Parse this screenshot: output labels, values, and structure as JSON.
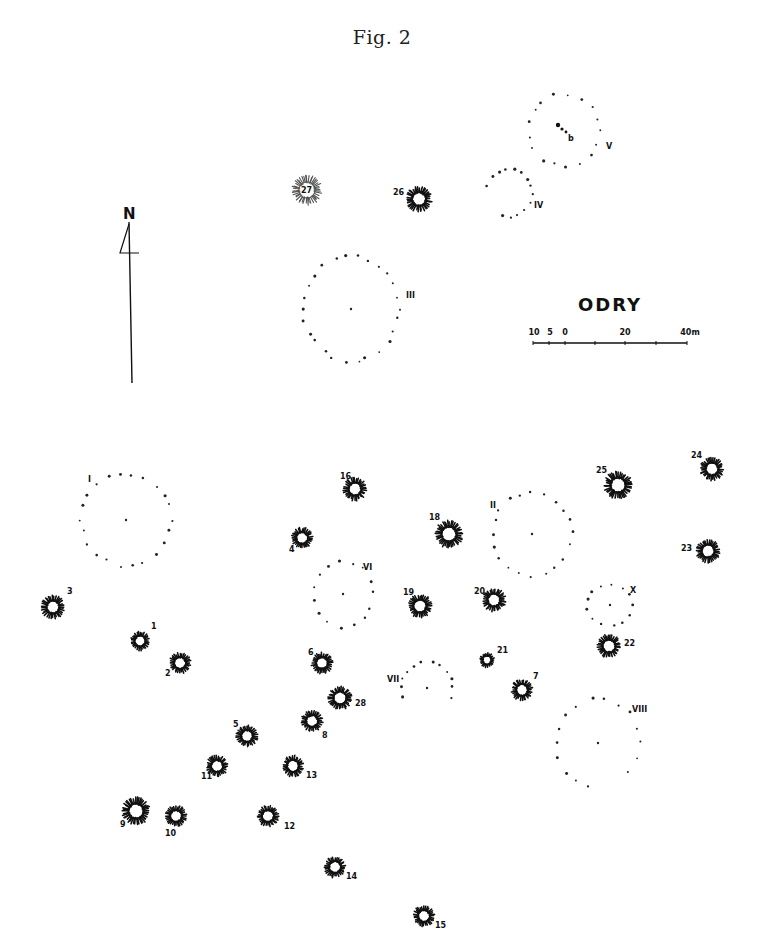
{
  "figure": {
    "title": "Fig. 2"
  },
  "site": {
    "name": "ODRY"
  },
  "north_arrow": {
    "label": "N",
    "x": 131,
    "top": 222,
    "bottom": 383
  },
  "scale_bar": {
    "x_start": 533,
    "x_end": 687,
    "y": 343,
    "labels": [
      {
        "text": "10",
        "x": 534
      },
      {
        "text": "5",
        "x": 550
      },
      {
        "text": "0",
        "x": 565
      },
      {
        "text": "20",
        "x": 625
      },
      {
        "text": "40m",
        "x": 690
      }
    ],
    "ticks": [
      533,
      549,
      565,
      595,
      625,
      656,
      687
    ]
  },
  "barrows": [
    {
      "id": "1",
      "x": 140,
      "y": 641,
      "r": 9,
      "label": "1",
      "lx": 151,
      "ly": 629
    },
    {
      "id": "2",
      "x": 180,
      "y": 663,
      "r": 10,
      "label": "2",
      "lx": 165,
      "ly": 676
    },
    {
      "id": "3",
      "x": 53,
      "y": 607,
      "r": 11,
      "label": "3",
      "lx": 67,
      "ly": 594
    },
    {
      "id": "4",
      "x": 302,
      "y": 538,
      "r": 10,
      "label": "4",
      "lx": 289,
      "ly": 552
    },
    {
      "id": "5",
      "x": 247,
      "y": 736,
      "r": 10,
      "label": "5",
      "lx": 233,
      "ly": 727
    },
    {
      "id": "6",
      "x": 322,
      "y": 663,
      "r": 10,
      "label": "6",
      "lx": 308,
      "ly": 655
    },
    {
      "id": "7",
      "x": 522,
      "y": 690,
      "r": 10,
      "label": "7",
      "lx": 533,
      "ly": 679
    },
    {
      "id": "8",
      "x": 312,
      "y": 721,
      "r": 10,
      "label": "8",
      "lx": 322,
      "ly": 738
    },
    {
      "id": "9",
      "x": 136,
      "y": 811,
      "r": 13,
      "label": "9",
      "lx": 120,
      "ly": 827
    },
    {
      "id": "10",
      "x": 176,
      "y": 816,
      "r": 10,
      "label": "10",
      "lx": 165,
      "ly": 836
    },
    {
      "id": "11",
      "x": 217,
      "y": 766,
      "r": 10,
      "label": "11",
      "lx": 201,
      "ly": 779
    },
    {
      "id": "12",
      "x": 268,
      "y": 816,
      "r": 10,
      "label": "12",
      "lx": 284,
      "ly": 829
    },
    {
      "id": "13",
      "x": 293,
      "y": 766,
      "r": 10,
      "label": "13",
      "lx": 306,
      "ly": 778
    },
    {
      "id": "14",
      "x": 335,
      "y": 867,
      "r": 10,
      "label": "14",
      "lx": 346,
      "ly": 879
    },
    {
      "id": "15",
      "x": 424,
      "y": 916,
      "r": 10,
      "label": "15",
      "lx": 435,
      "ly": 928
    },
    {
      "id": "16",
      "x": 355,
      "y": 489,
      "r": 11,
      "label": "16",
      "lx": 340,
      "ly": 479
    },
    {
      "id": "18",
      "x": 449,
      "y": 534,
      "r": 13,
      "label": "18",
      "lx": 429,
      "ly": 520
    },
    {
      "id": "19",
      "x": 420,
      "y": 606,
      "r": 11,
      "label": "19",
      "lx": 403,
      "ly": 595
    },
    {
      "id": "20",
      "x": 494,
      "y": 600,
      "r": 11,
      "label": "20",
      "lx": 474,
      "ly": 594
    },
    {
      "id": "21",
      "x": 487,
      "y": 660,
      "r": 7,
      "label": "21",
      "lx": 497,
      "ly": 653
    },
    {
      "id": "22",
      "x": 609,
      "y": 646,
      "r": 11,
      "label": "22",
      "lx": 624,
      "ly": 646
    },
    {
      "id": "23",
      "x": 708,
      "y": 551,
      "r": 11,
      "label": "23",
      "lx": 681,
      "ly": 551
    },
    {
      "id": "24",
      "x": 712,
      "y": 469,
      "r": 11,
      "label": "24",
      "lx": 691,
      "ly": 458
    },
    {
      "id": "25",
      "x": 618,
      "y": 485,
      "r": 13,
      "label": "25",
      "lx": 596,
      "ly": 473
    },
    {
      "id": "26",
      "x": 419,
      "y": 199,
      "r": 12,
      "label": "26",
      "lx": 393,
      "ly": 195
    },
    {
      "id": "27",
      "x": 307,
      "y": 190,
      "r": 14,
      "label": "27",
      "lx": 301,
      "ly": 193,
      "faint": true
    },
    {
      "id": "28",
      "x": 340,
      "y": 698,
      "r": 11,
      "label": "28",
      "lx": 355,
      "ly": 706
    }
  ],
  "stone_circles": [
    {
      "id": "I",
      "cx": 126,
      "cy": 520,
      "rx": 45,
      "ry": 46,
      "dots": 22,
      "label": "I",
      "lx": 88,
      "ly": 482,
      "center": true
    },
    {
      "id": "II",
      "cx": 532,
      "cy": 534,
      "rx": 40,
      "ry": 42,
      "dots": 20,
      "label": "II",
      "lx": 490,
      "ly": 508,
      "center": true
    },
    {
      "id": "III",
      "cx": 351,
      "cy": 309,
      "rx": 48,
      "ry": 52,
      "dots": 26,
      "label": "III",
      "lx": 406,
      "ly": 298,
      "center": true
    },
    {
      "id": "IV",
      "cx": 509,
      "cy": 193,
      "rx": 23,
      "ry": 24,
      "dots": 14,
      "label": "IV",
      "lx": 534,
      "ly": 208,
      "center": false,
      "arc": [
        200,
        470
      ]
    },
    {
      "id": "V",
      "cx": 564,
      "cy": 130,
      "rx": 36,
      "ry": 36,
      "dots": 17,
      "label": "V",
      "lx": 606,
      "ly": 149,
      "center": false
    },
    {
      "id": "VI",
      "cx": 343,
      "cy": 594,
      "rx": 30,
      "ry": 33,
      "dots": 15,
      "label": "VI",
      "lx": 363,
      "ly": 570,
      "center": true
    },
    {
      "id": "VII",
      "cx": 427,
      "cy": 688,
      "rx": 26,
      "ry": 26,
      "dots": 12,
      "label": "VII",
      "lx": 387,
      "ly": 682,
      "center": true,
      "arc": [
        160,
        380
      ]
    },
    {
      "id": "VIII",
      "cx": 598,
      "cy": 743,
      "rx": 42,
      "ry": 45,
      "dots": 16,
      "label": "VIII",
      "lx": 632,
      "ly": 712,
      "center": true,
      "arc": [
        100,
        400
      ]
    },
    {
      "id": "X",
      "cx": 610,
      "cy": 605,
      "rx": 23,
      "ry": 21,
      "dots": 13,
      "label": "X",
      "lx": 630,
      "ly": 593,
      "center": true
    }
  ],
  "circle_v_stones": [
    {
      "x": 558,
      "y": 125,
      "r": 2.2
    },
    {
      "x": 562,
      "y": 129,
      "r": 1.6
    },
    {
      "x": 566,
      "y": 132,
      "r": 1.4
    }
  ],
  "circle_v_stone_label": {
    "text": "b",
    "x": 568,
    "y": 141
  }
}
